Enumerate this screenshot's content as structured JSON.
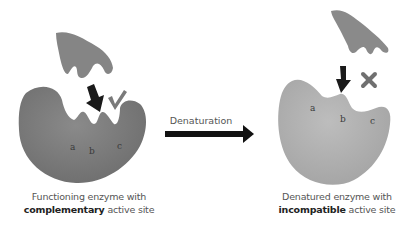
{
  "process": {
    "arrow_label": "Denaturation"
  },
  "left_panel": {
    "caption_line1": "Functioning enzyme with",
    "caption_bold": "complementary",
    "caption_rest": " active site",
    "site_labels": [
      "a",
      "b",
      "c"
    ],
    "indicator": "check-mark",
    "colors": {
      "enzyme": "#808080",
      "substrate": "#858585",
      "arrow": "#1a1a1a"
    }
  },
  "right_panel": {
    "caption_line1": "Denatured enzyme with",
    "caption_bold": "incompatible",
    "caption_rest": " active site",
    "site_labels": [
      "a",
      "b",
      "c"
    ],
    "indicator": "cross-mark",
    "colors": {
      "enzyme": "#b0b0b0",
      "substrate": "#8a8a8a",
      "arrow": "#1a1a1a"
    }
  }
}
